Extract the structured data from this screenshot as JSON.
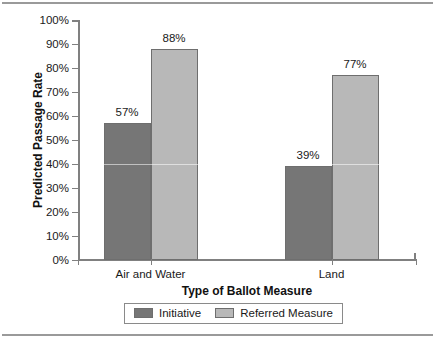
{
  "chart_data": {
    "type": "bar",
    "title": "",
    "subtitle": "",
    "xlabel": "Type of Ballot Measure",
    "ylabel": "Predicted Passage Rate",
    "categories": [
      "Air and Water",
      "Land"
    ],
    "series": [
      {
        "name": "Initiative",
        "color": "#767676",
        "values": [
          57,
          39
        ],
        "value_labels": [
          "57%",
          "39%"
        ]
      },
      {
        "name": "Referred Measure",
        "color": "#b8b8b8",
        "values": [
          88,
          77
        ],
        "value_labels": [
          "88%",
          "77%"
        ]
      }
    ],
    "ylim": [
      0,
      100
    ],
    "ytick_values": [
      0,
      10,
      20,
      30,
      40,
      50,
      60,
      70,
      80,
      90,
      100
    ],
    "ytick_labels": [
      "0%",
      "10%",
      "20%",
      "30%",
      "40%",
      "50%",
      "60%",
      "70%",
      "80%",
      "90%",
      "100%"
    ],
    "grid": false,
    "legend_position": "bottom-center"
  },
  "colors": {
    "initiative": "#767676",
    "referred_measure": "#b8b8b8",
    "axis": "#808080",
    "text": "#1a1a1a",
    "rule": "#9a9a9a"
  },
  "legend": {
    "entries": [
      {
        "label": "Initiative"
      },
      {
        "label": "Referred Measure"
      }
    ]
  },
  "axes": {
    "y_title": "Predicted Passage Rate",
    "x_title": "Type of Ballot Measure",
    "y_ticks": [
      "100%",
      "90%",
      "80%",
      "70%",
      "60%",
      "50%",
      "40%",
      "30%",
      "20%",
      "10%",
      "0%"
    ],
    "x_ticks": [
      "Air and Water",
      "Land"
    ]
  }
}
